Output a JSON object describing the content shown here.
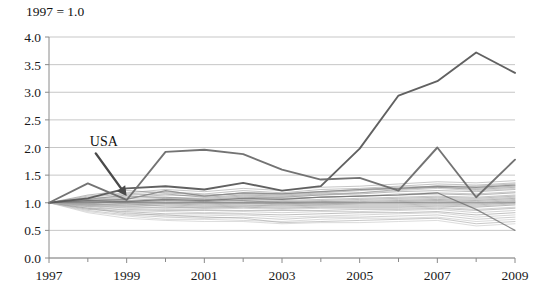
{
  "chart_data": {
    "type": "line",
    "title": "",
    "note": "1997 = 1.0",
    "xlabel": "",
    "ylabel": "",
    "xlim": [
      1997,
      2009
    ],
    "ylim": [
      0.0,
      4.0
    ],
    "yticks": [
      "0.0",
      "0.5",
      "1.0",
      "1.5",
      "2.0",
      "2.5",
      "3.0",
      "3.5",
      "4.0"
    ],
    "ytick_values": [
      0.0,
      0.5,
      1.0,
      1.5,
      2.0,
      2.5,
      3.0,
      3.5,
      4.0
    ],
    "xticks": [
      "1997",
      "1999",
      "2001",
      "2003",
      "2005",
      "2007",
      "2009"
    ],
    "xtick_values": [
      1997,
      1999,
      2001,
      2003,
      2005,
      2007,
      2009
    ],
    "x_minor_ticks": [
      1998,
      2000,
      2002,
      2004,
      2006,
      2008
    ],
    "grid": "horizontal",
    "legend": "none",
    "annotations": [
      {
        "text": "USA",
        "x_label": 1998.05,
        "y_label": 2.02,
        "points_to_x": 1999.0,
        "points_to_y": 1.12
      }
    ],
    "x": [
      1997,
      1998,
      1999,
      2000,
      2001,
      2002,
      2003,
      2004,
      2005,
      2006,
      2007,
      2008,
      2009
    ],
    "series": [
      {
        "name": "highlight-outlier",
        "emphasis": "high",
        "color": "#595959",
        "values": [
          1.0,
          1.08,
          1.26,
          1.3,
          1.24,
          1.36,
          1.22,
          1.3,
          1.98,
          2.94,
          3.2,
          3.72,
          3.35
        ]
      },
      {
        "name": "highlight-second",
        "emphasis": "high",
        "color": "#6b6b6b",
        "values": [
          1.0,
          1.35,
          1.05,
          1.92,
          1.96,
          1.88,
          1.6,
          1.42,
          1.45,
          1.22,
          2.0,
          1.1,
          1.78
        ]
      },
      {
        "name": "usa-line",
        "emphasis": "mid",
        "color": "#7a7a7a",
        "values": [
          1.0,
          1.04,
          1.06,
          1.22,
          1.12,
          1.18,
          1.16,
          1.2,
          1.24,
          1.26,
          1.3,
          1.28,
          1.32
        ]
      },
      {
        "name": "bg-01",
        "emphasis": "low",
        "color": "#9a9a9a",
        "values": [
          1.0,
          1.12,
          1.18,
          1.24,
          1.2,
          1.26,
          1.22,
          1.28,
          1.3,
          1.34,
          1.38,
          1.36,
          1.4
        ]
      },
      {
        "name": "bg-02",
        "emphasis": "low",
        "color": "#8f8f8f",
        "values": [
          1.0,
          1.06,
          1.1,
          1.14,
          1.12,
          1.18,
          1.16,
          1.2,
          1.24,
          1.28,
          1.3,
          1.3,
          1.34
        ]
      },
      {
        "name": "bg-03",
        "emphasis": "low",
        "color": "#a6a6a6",
        "values": [
          1.0,
          0.98,
          1.02,
          1.06,
          1.04,
          1.08,
          1.1,
          1.14,
          1.18,
          1.22,
          1.26,
          1.22,
          1.26
        ]
      },
      {
        "name": "bg-04",
        "emphasis": "low",
        "color": "#888888",
        "values": [
          1.0,
          1.04,
          1.08,
          1.1,
          1.08,
          1.12,
          1.1,
          1.14,
          1.16,
          1.2,
          1.22,
          1.2,
          1.24
        ]
      },
      {
        "name": "bg-05",
        "emphasis": "low",
        "color": "#9e9e9e",
        "values": [
          1.0,
          1.02,
          1.0,
          1.04,
          1.02,
          1.06,
          1.06,
          1.1,
          1.12,
          1.16,
          1.18,
          1.16,
          1.2
        ]
      },
      {
        "name": "bg-06",
        "emphasis": "low",
        "color": "#7f7f7f",
        "values": [
          1.0,
          1.0,
          1.04,
          1.08,
          1.06,
          1.1,
          1.08,
          1.1,
          1.12,
          1.14,
          1.16,
          1.14,
          1.18
        ]
      },
      {
        "name": "bg-07",
        "emphasis": "low",
        "color": "#949494",
        "values": [
          1.0,
          0.96,
          0.98,
          1.0,
          1.0,
          1.02,
          1.04,
          1.06,
          1.08,
          1.1,
          1.12,
          1.1,
          1.14
        ]
      },
      {
        "name": "bg-08",
        "emphasis": "low",
        "color": "#8c8c8c",
        "values": [
          1.0,
          1.08,
          1.12,
          1.1,
          1.06,
          1.04,
          1.02,
          1.04,
          1.06,
          1.08,
          1.1,
          1.08,
          1.12
        ]
      },
      {
        "name": "bg-09",
        "emphasis": "low",
        "color": "#a0a0a0",
        "values": [
          1.0,
          1.01,
          1.0,
          1.02,
          1.0,
          1.0,
          1.02,
          1.02,
          1.04,
          1.06,
          1.08,
          1.06,
          1.1
        ]
      },
      {
        "name": "bg-10",
        "emphasis": "low",
        "color": "#7b7b7b",
        "values": [
          1.0,
          0.99,
          1.02,
          1.04,
          1.02,
          1.04,
          1.0,
          1.02,
          1.02,
          1.04,
          1.06,
          1.04,
          1.08
        ]
      },
      {
        "name": "bg-11",
        "emphasis": "low",
        "color": "#919191",
        "values": [
          1.0,
          1.03,
          1.01,
          0.99,
          0.98,
          1.0,
          0.98,
          1.0,
          1.0,
          1.02,
          1.04,
          1.02,
          1.06
        ]
      },
      {
        "name": "bg-12",
        "emphasis": "low",
        "color": "#868686",
        "values": [
          1.0,
          0.97,
          0.96,
          0.98,
          0.96,
          0.98,
          0.98,
          0.98,
          1.0,
          1.0,
          1.02,
          1.0,
          1.04
        ]
      },
      {
        "name": "bg-13",
        "emphasis": "low",
        "color": "#a2a2a2",
        "values": [
          1.0,
          1.05,
          1.03,
          1.01,
          1.0,
          0.99,
          0.96,
          0.96,
          0.98,
          0.98,
          1.0,
          0.98,
          1.02
        ]
      },
      {
        "name": "bg-14",
        "emphasis": "low",
        "color": "#8a8a8a",
        "values": [
          1.0,
          0.95,
          0.94,
          0.96,
          0.94,
          0.96,
          0.94,
          0.96,
          0.96,
          0.96,
          0.98,
          0.96,
          1.0
        ]
      },
      {
        "name": "bg-15",
        "emphasis": "low",
        "color": "#999999",
        "values": [
          1.0,
          1.02,
          0.98,
          0.94,
          0.92,
          0.94,
          0.92,
          0.94,
          0.94,
          0.94,
          0.96,
          0.94,
          0.98
        ]
      },
      {
        "name": "bg-16",
        "emphasis": "low",
        "color": "#828282",
        "values": [
          1.0,
          0.93,
          0.92,
          0.92,
          0.9,
          0.92,
          0.9,
          0.92,
          0.92,
          0.92,
          0.94,
          0.92,
          0.96
        ]
      },
      {
        "name": "bg-17",
        "emphasis": "low",
        "color": "#adadad",
        "values": [
          1.0,
          0.96,
          0.9,
          0.88,
          0.88,
          0.9,
          0.88,
          0.9,
          0.9,
          0.9,
          0.92,
          0.88,
          0.92
        ]
      },
      {
        "name": "bg-18",
        "emphasis": "low",
        "color": "#969696",
        "values": [
          1.0,
          0.9,
          0.88,
          0.86,
          0.86,
          0.86,
          0.86,
          0.86,
          0.88,
          0.88,
          0.9,
          0.86,
          0.9
        ]
      },
      {
        "name": "bg-19",
        "emphasis": "low",
        "color": "#b0b0b0",
        "values": [
          1.0,
          0.94,
          0.86,
          0.84,
          0.82,
          0.84,
          0.82,
          0.84,
          0.84,
          0.86,
          0.88,
          0.82,
          0.86
        ]
      },
      {
        "name": "bg-20",
        "emphasis": "low",
        "color": "#8e8e8e",
        "values": [
          1.0,
          0.88,
          0.84,
          0.8,
          0.8,
          0.8,
          0.78,
          0.8,
          0.82,
          0.82,
          0.84,
          0.78,
          0.82
        ]
      },
      {
        "name": "bg-21",
        "emphasis": "low",
        "color": "#b6b6b6",
        "values": [
          1.0,
          0.92,
          0.82,
          0.76,
          0.76,
          0.78,
          0.74,
          0.76,
          0.78,
          0.8,
          0.82,
          0.74,
          0.78
        ]
      },
      {
        "name": "bg-22",
        "emphasis": "low",
        "color": "#a8a8a8",
        "values": [
          1.0,
          0.86,
          0.78,
          0.74,
          0.72,
          0.74,
          0.7,
          0.74,
          0.74,
          0.76,
          0.78,
          0.7,
          0.74
        ]
      },
      {
        "name": "bg-23",
        "emphasis": "low",
        "color": "#bcbcbc",
        "values": [
          1.0,
          0.84,
          0.76,
          0.7,
          0.7,
          0.68,
          0.66,
          0.7,
          0.72,
          0.72,
          0.74,
          0.66,
          0.7
        ]
      },
      {
        "name": "bg-24",
        "emphasis": "low",
        "color": "#9c9c9c",
        "values": [
          1.0,
          0.9,
          0.8,
          0.78,
          0.74,
          0.72,
          0.64,
          0.66,
          0.68,
          0.7,
          0.72,
          0.62,
          0.66
        ]
      },
      {
        "name": "bg-25",
        "emphasis": "low",
        "color": "#c0c0c0",
        "values": [
          1.0,
          0.82,
          0.72,
          0.68,
          0.66,
          0.66,
          0.62,
          0.64,
          0.64,
          0.66,
          0.68,
          0.58,
          0.62
        ]
      },
      {
        "name": "bg-26",
        "emphasis": "low",
        "color": "#929292",
        "values": [
          1.0,
          1.1,
          1.16,
          1.2,
          1.16,
          1.22,
          1.18,
          1.24,
          1.26,
          1.3,
          1.34,
          1.32,
          1.36
        ]
      },
      {
        "name": "bg-27",
        "emphasis": "low",
        "color": "#858585",
        "values": [
          1.0,
          1.14,
          1.22,
          1.18,
          1.14,
          1.16,
          1.14,
          1.18,
          1.22,
          1.26,
          1.28,
          1.26,
          1.3
        ]
      },
      {
        "name": "bg-28",
        "emphasis": "low",
        "color": "#707070",
        "values": [
          1.0,
          1.0,
          1.0,
          1.0,
          1.0,
          1.0,
          1.0,
          1.0,
          1.0,
          1.0,
          1.0,
          1.0,
          1.0
        ]
      },
      {
        "name": "bg-29",
        "emphasis": "low",
        "color": "#ababab",
        "values": [
          1.0,
          0.98,
          0.94,
          0.9,
          0.92,
          0.94,
          0.96,
          0.98,
          1.0,
          1.02,
          1.04,
          1.0,
          1.02
        ]
      },
      {
        "name": "bg-30",
        "emphasis": "low",
        "color": "#7e7e7e",
        "values": [
          1.0,
          1.06,
          1.14,
          1.16,
          1.1,
          1.14,
          1.12,
          1.16,
          1.18,
          1.24,
          1.28,
          1.24,
          1.28
        ]
      },
      {
        "name": "bg-31-drop",
        "emphasis": "mid",
        "color": "#6f6f6f",
        "values": [
          1.0,
          1.04,
          1.02,
          1.06,
          1.04,
          1.08,
          1.06,
          1.1,
          1.12,
          1.14,
          1.18,
          0.88,
          0.5
        ]
      }
    ]
  },
  "plot_geometry": {
    "left": 49,
    "right": 515,
    "top": 37,
    "bottom": 258
  }
}
